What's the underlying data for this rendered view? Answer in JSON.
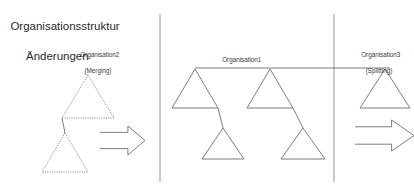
{
  "title": {
    "line1": "Organisationsstruktur",
    "line2": "Änderungen"
  },
  "panels": {
    "left": {
      "label": "Organisation2",
      "sublabel": "(Merging)"
    },
    "middle": {
      "label": "Organisation1",
      "sublabel": ""
    },
    "right": {
      "label": "Organisation3",
      "sublabel": "(Splitting)"
    }
  },
  "colors": {
    "stroke": "#6e6e6e",
    "divider": "#8a8a8a",
    "text": "#3a3a3a",
    "title": "#2b2b2b",
    "background": "#ffffff"
  },
  "diagram": {
    "type": "organisation-structure-change",
    "left_triangles": [
      {
        "apex_x": 88,
        "apex_y": 75,
        "base_y": 118,
        "half_width": 26,
        "style": "dotted"
      },
      {
        "apex_x": 65,
        "apex_y": 133,
        "base_y": 172,
        "half_width": 23,
        "style": "dotted"
      }
    ],
    "left_connector": {
      "x1": 62,
      "y1": 118,
      "x2": 65,
      "y2": 133
    },
    "left_arrow": {
      "x": 100,
      "y": 126,
      "width": 45,
      "height": 29,
      "direction": "right"
    },
    "middle_triangles": [
      {
        "apex_x": 195,
        "apex_y": 69,
        "base_y": 108,
        "half_width": 23,
        "style": "solid"
      },
      {
        "apex_x": 223,
        "apex_y": 128,
        "base_y": 159,
        "half_width": 21,
        "style": "solid"
      },
      {
        "apex_x": 270,
        "apex_y": 69,
        "base_y": 108,
        "half_width": 23,
        "style": "solid"
      },
      {
        "apex_x": 303,
        "apex_y": 128,
        "base_y": 159,
        "half_width": 22,
        "style": "solid"
      }
    ],
    "middle_connectors": [
      {
        "x1": 218,
        "y1": 108,
        "x2": 223,
        "y2": 128
      },
      {
        "x1": 293,
        "y1": 108,
        "x2": 303,
        "y2": 128
      }
    ],
    "right_triangles": [
      {
        "apex_x": 385,
        "apex_y": 69,
        "base_y": 108,
        "half_width": 25,
        "style": "solid"
      }
    ],
    "right_arrow": {
      "x": 355,
      "y": 120,
      "width": 59,
      "height": 31,
      "direction": "right"
    },
    "top_horizontal_line": {
      "x1": 195,
      "y1": 68,
      "x2": 390,
      "y2": 68
    },
    "dividers": [
      {
        "x": 160,
        "y1": 14,
        "y2": 182
      },
      {
        "x": 334,
        "y1": 14,
        "y2": 182
      }
    ]
  }
}
